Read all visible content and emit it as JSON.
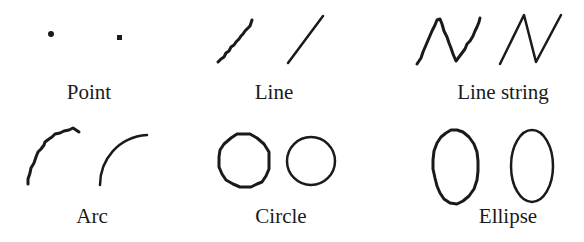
{
  "diagram": {
    "items": [
      {
        "id": "point",
        "label": "Point",
        "label_pos": [
          89,
          82
        ]
      },
      {
        "id": "line",
        "label": "Line",
        "label_pos": [
          274,
          82
        ]
      },
      {
        "id": "line-string",
        "label": "Line string",
        "label_pos": [
          503,
          82
        ]
      },
      {
        "id": "arc",
        "label": "Arc",
        "label_pos": [
          92,
          206
        ]
      },
      {
        "id": "circle",
        "label": "Circle",
        "label_pos": [
          281,
          206
        ]
      },
      {
        "id": "ellipse",
        "label": "Ellipse",
        "label_pos": [
          508,
          206
        ]
      }
    ],
    "stroke_color": "#1a1a1a",
    "background": "#ffffff"
  }
}
